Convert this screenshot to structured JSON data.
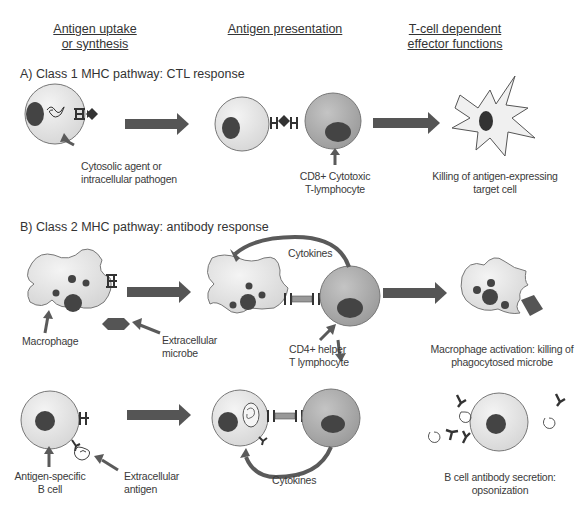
{
  "headers": {
    "col1_line1": "Antigen uptake",
    "col1_line2": "or synthesis",
    "col2": "Antigen presentation",
    "col3_line1": "T-cell dependent",
    "col3_line2": "effector functions"
  },
  "section_a": {
    "title": "A) Class 1 MHC pathway: CTL response",
    "label_cytosolic_1": "Cytosolic agent or",
    "label_cytosolic_2": "intracellular pathogen",
    "label_cd8_1": "CD8+ Cytotoxic",
    "label_cd8_2": "T-lymphocyte",
    "label_killing_1": "Killing of antigen-expressing",
    "label_killing_2": "target cell"
  },
  "section_b": {
    "title": "B) Class 2 MHC pathway: antibody response",
    "label_macrophage": "Macrophage",
    "label_microbe_1": "Extracellular",
    "label_microbe_2": "microbe",
    "label_cytokines_top": "Cytokines",
    "label_cd4_1": "CD4+ helper",
    "label_cd4_2": "T lymphocyte",
    "label_mac_act_1": "Macrophage activation: killing of",
    "label_mac_act_2": "phagocytosed microbe",
    "label_bcell_1": "Antigen-specific",
    "label_bcell_2": "B cell",
    "label_antigen_1": "Extracellular",
    "label_antigen_2": "antigen",
    "label_cytokines_bottom": "Cytokines",
    "label_secretion_1": "B cell antibody secretion:",
    "label_secretion_2": "opsonization"
  },
  "colors": {
    "cell_fill": "#e6e6e6",
    "tcell_fill": "#a8a8a8",
    "nucleus": "#555555",
    "arrow": "#5a5a5a"
  }
}
